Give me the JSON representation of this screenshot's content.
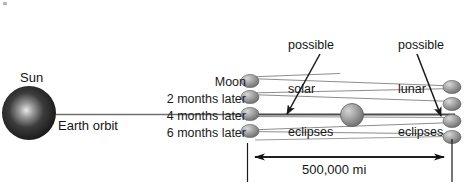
{
  "diagram": {
    "bodies": {
      "sun_label": "Sun",
      "earth_orbit_label": "Earth orbit",
      "moon_label": "Moon"
    },
    "time_labels": [
      "Moon",
      "2 months later",
      "4 months later",
      "6 months later"
    ],
    "annotations": {
      "solar": [
        "possible",
        "solar",
        "eclipses"
      ],
      "lunar": [
        "possible",
        "lunar",
        "eclipses"
      ]
    },
    "dimension": {
      "value": "500,000 mi"
    },
    "colors": {
      "sun_fill": "#2b2b2b",
      "sun_highlight": "#d8d8d8",
      "earth_fill": "#9a9a9a",
      "moon_fill": "#9e9e9e",
      "line": "#6b6b6b",
      "dim_line": "#1a1a1a",
      "text": "#141414",
      "background": "#ffffff"
    },
    "counts": {
      "moons_left": 4,
      "moons_right": 4,
      "orbit_lines": 8
    }
  }
}
